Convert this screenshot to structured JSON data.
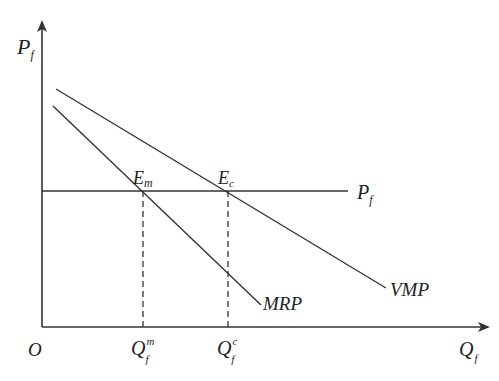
{
  "diagram": {
    "title": "",
    "axes": {
      "y_label": {
        "main": "P",
        "sub": "f"
      },
      "x_label": {
        "main": "Q",
        "sub": "f"
      },
      "origin": "O"
    },
    "curves": {
      "vmp": "VMP",
      "mrp": "MRP",
      "price_line": {
        "main": "P",
        "sub": "f"
      }
    },
    "points": {
      "em": {
        "main": "E",
        "sub": "m"
      },
      "ec": {
        "main": "E",
        "sub": "c"
      }
    },
    "ticks": {
      "qm": {
        "main": "Q",
        "sub": "f",
        "sup": "m"
      },
      "qc": {
        "main": "Q",
        "sub": "f",
        "sup": "c"
      }
    },
    "colors": {
      "line": "#333333",
      "background": "#ffffff"
    }
  }
}
